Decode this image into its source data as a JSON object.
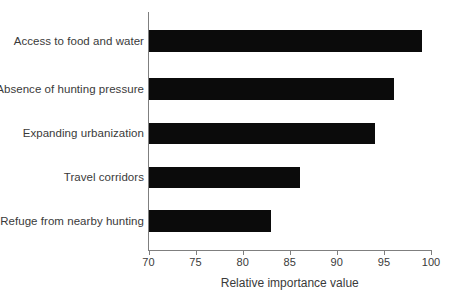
{
  "chart_data": {
    "type": "bar",
    "orientation": "horizontal",
    "title": "",
    "subtitle": "",
    "xlabel": "Relative importance value",
    "ylabel": "",
    "categories": [
      "Access to food and water",
      "Absence of hunting pressure",
      "Expanding urbanization",
      "Travel corridors",
      "Refuge from nearby hunting"
    ],
    "values": [
      99,
      96,
      94,
      86,
      83
    ],
    "xlim": [
      70,
      100
    ],
    "xticks": [
      70,
      75,
      80,
      85,
      90,
      95,
      100
    ],
    "xtick_labels": [
      "70",
      "75",
      "80",
      "85",
      "90",
      "95",
      "100"
    ],
    "grid": false,
    "legend": false,
    "legend_position": "none",
    "bar_color": "#0b0b0b",
    "axis_color": "#7f7f7f",
    "text_color": "#3a3a3a",
    "background_color": "#ffffff"
  },
  "bars": [
    {
      "label": "Access to food and water",
      "value": 99,
      "top": 30,
      "height": 22
    },
    {
      "label": "Absence of hunting pressure",
      "value": 96,
      "top": 78,
      "height": 22
    },
    {
      "label": "Expanding urbanization",
      "value": 94,
      "top": 123,
      "height": 21
    },
    {
      "label": "Travel corridors",
      "value": 86,
      "top": 167,
      "height": 21
    },
    {
      "label": "Refuge from nearby hunting",
      "value": 83,
      "top": 210,
      "height": 22
    }
  ]
}
